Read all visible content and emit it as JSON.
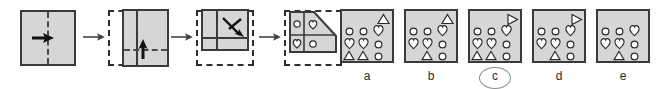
{
  "puzzle": {
    "type": "paper-folding-punch",
    "sequence": [
      {
        "id": "step-1",
        "name": "unfolded-square",
        "outline": "solid",
        "fold_line": "vertical-center-dashed",
        "arrow": "right",
        "description": "Square sheet with vertical center fold line, fold to the right"
      },
      {
        "id": "step-2",
        "name": "folded-once",
        "outline": "dashed-ghost",
        "fold_line": "horizontal-lower-dashed",
        "arrow": "up",
        "description": "Half sheet after vertical fold, horizontal fold line, fold upward"
      },
      {
        "id": "step-3",
        "name": "folded-twice",
        "outline": "dashed-ghost",
        "fold_line": "diagonal",
        "arrow": "down-right-diagonal",
        "description": "Quarter sheet after horizontal fold, diagonal fold indicated"
      },
      {
        "id": "step-4",
        "name": "punched-stack",
        "outline": "dashed-ghost",
        "fold_line": "diagonal-cut",
        "arrow": null,
        "description": "Folded stack with diagonal edge and punched holes",
        "punches": [
          {
            "row": 0,
            "col": 0,
            "shape": "circle"
          },
          {
            "row": 0,
            "col": 1,
            "shape": "heart"
          },
          {
            "row": 1,
            "col": 0,
            "shape": "heart"
          },
          {
            "row": 1,
            "col": 1,
            "shape": "circle"
          }
        ]
      }
    ],
    "step_arrow_glyph": "arrow-right",
    "options": [
      {
        "id": "option-a",
        "label": "a",
        "selected": false,
        "corner_mark": "triangle-up",
        "grid": [
          [
            "circle",
            "circle",
            "heart"
          ],
          [
            "heart",
            "heart",
            "circle"
          ],
          [
            "triangle",
            "triangle",
            "circle"
          ]
        ]
      },
      {
        "id": "option-b",
        "label": "b",
        "selected": false,
        "corner_mark": "triangle-up",
        "grid": [
          [
            "circle",
            "circle",
            "heart"
          ],
          [
            "heart",
            "heart",
            "circle"
          ],
          [
            null,
            "triangle",
            "circle"
          ]
        ]
      },
      {
        "id": "option-c",
        "label": "c",
        "selected": true,
        "corner_mark": "triangle-right",
        "grid": [
          [
            "circle",
            "circle",
            "heart"
          ],
          [
            "heart",
            "heart",
            "circle"
          ],
          [
            "triangle",
            "triangle",
            "circle"
          ]
        ]
      },
      {
        "id": "option-d",
        "label": "d",
        "selected": false,
        "corner_mark": "triangle-right",
        "grid": [
          [
            "circle",
            "circle",
            "heart"
          ],
          [
            "heart",
            "heart",
            "circle"
          ],
          [
            null,
            "triangle",
            "circle"
          ]
        ]
      },
      {
        "id": "option-e",
        "label": "e",
        "selected": false,
        "corner_mark": null,
        "grid": [
          [
            "circle",
            "circle",
            "heart"
          ],
          [
            "heart",
            "heart",
            "circle"
          ],
          [
            null,
            "triangle",
            "circle"
          ]
        ]
      }
    ],
    "colors": {
      "paper": "#d6d6d6",
      "ink": "#3a3a3a",
      "crease": "#4a4a4a",
      "hole_outline": "#2b2b2b",
      "hole_fill": "#ffffff",
      "label_text": "#2b2b2b",
      "selection_ring": "#8d8d8d",
      "background": "#ffffff"
    }
  }
}
